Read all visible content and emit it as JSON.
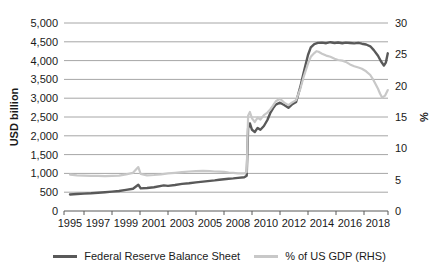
{
  "chart_data": {
    "type": "line",
    "title": "",
    "legend_position": "bottom",
    "grid": true,
    "grid_color": "#a6a6a6",
    "axis_color": "#595959",
    "text_color": "#1a1a1a",
    "x_axis": {
      "tick_labels": [
        "1995",
        "1997",
        "1999",
        "2001",
        "2003",
        "2005",
        "2008",
        "2010",
        "2012",
        "2014",
        "2016",
        "2018"
      ],
      "tick_years": [
        1995,
        1997,
        1999,
        2001,
        2003,
        2005,
        2008,
        2010,
        2012,
        2014,
        2016,
        2018
      ]
    },
    "left_axis": {
      "label": "USD billion",
      "min": 0,
      "max": 5000,
      "step": 500,
      "tick_labels": [
        "5,000",
        "4,500",
        "4,000",
        "3,500",
        "3,000",
        "2,500",
        "2,000",
        "1,500",
        "1,000",
        "500",
        "0"
      ]
    },
    "right_axis": {
      "label": "%",
      "min": 0,
      "max": 30,
      "step": 5,
      "tick_labels": [
        "30",
        "25",
        "20",
        "15",
        "10",
        "5",
        "0"
      ]
    },
    "series": [
      {
        "name": "Federal Reserve Balance Sheet",
        "axis": "left",
        "color": "#595959",
        "points": [
          [
            1995.0,
            440
          ],
          [
            1995.5,
            452
          ],
          [
            1996.0,
            462
          ],
          [
            1996.5,
            472
          ],
          [
            1997.0,
            486
          ],
          [
            1997.5,
            500
          ],
          [
            1998.0,
            515
          ],
          [
            1998.5,
            532
          ],
          [
            1999.0,
            560
          ],
          [
            1999.5,
            592
          ],
          [
            1999.88,
            700
          ],
          [
            2000.05,
            602
          ],
          [
            2000.5,
            612
          ],
          [
            2001.0,
            632
          ],
          [
            2001.7,
            682
          ],
          [
            2002.0,
            668
          ],
          [
            2002.5,
            692
          ],
          [
            2003.0,
            720
          ],
          [
            2003.5,
            738
          ],
          [
            2004.0,
            760
          ],
          [
            2004.5,
            782
          ],
          [
            2005.0,
            800
          ],
          [
            2005.5,
            815
          ],
          [
            2006.0,
            830
          ],
          [
            2006.5,
            845
          ],
          [
            2007.0,
            858
          ],
          [
            2007.5,
            868
          ],
          [
            2008.0,
            880
          ],
          [
            2008.45,
            898
          ],
          [
            2008.62,
            940
          ],
          [
            2008.72,
            2200
          ],
          [
            2008.85,
            2330
          ],
          [
            2009.0,
            2160
          ],
          [
            2009.2,
            2100
          ],
          [
            2009.4,
            2210
          ],
          [
            2009.6,
            2160
          ],
          [
            2009.85,
            2260
          ],
          [
            2010.1,
            2420
          ],
          [
            2010.3,
            2600
          ],
          [
            2010.5,
            2730
          ],
          [
            2010.7,
            2830
          ],
          [
            2011.0,
            2880
          ],
          [
            2011.3,
            2820
          ],
          [
            2011.6,
            2745
          ],
          [
            2011.85,
            2830
          ],
          [
            2012.15,
            2900
          ],
          [
            2012.45,
            3300
          ],
          [
            2012.7,
            3700
          ],
          [
            2013.0,
            4150
          ],
          [
            2013.2,
            4350
          ],
          [
            2013.45,
            4440
          ],
          [
            2013.7,
            4470
          ],
          [
            2014.0,
            4480
          ],
          [
            2014.3,
            4462
          ],
          [
            2014.6,
            4490
          ],
          [
            2014.9,
            4468
          ],
          [
            2015.15,
            4482
          ],
          [
            2015.45,
            4462
          ],
          [
            2015.7,
            4480
          ],
          [
            2016.0,
            4468
          ],
          [
            2016.3,
            4458
          ],
          [
            2016.6,
            4470
          ],
          [
            2016.85,
            4450
          ],
          [
            2017.15,
            4428
          ],
          [
            2017.45,
            4380
          ],
          [
            2017.7,
            4280
          ],
          [
            2018.0,
            4130
          ],
          [
            2018.2,
            3990
          ],
          [
            2018.42,
            3868
          ],
          [
            2018.56,
            3945
          ],
          [
            2018.7,
            4195
          ]
        ]
      },
      {
        "name": "% of US GDP (RHS)",
        "axis": "right",
        "color": "#c8c8c8",
        "points": [
          [
            1995.0,
            5.8
          ],
          [
            1995.5,
            5.7
          ],
          [
            1996.0,
            5.65
          ],
          [
            1996.5,
            5.6
          ],
          [
            1997.0,
            5.6
          ],
          [
            1997.5,
            5.55
          ],
          [
            1998.0,
            5.6
          ],
          [
            1998.5,
            5.65
          ],
          [
            1999.0,
            5.85
          ],
          [
            1999.5,
            6.1
          ],
          [
            1999.88,
            7.0
          ],
          [
            2000.05,
            5.9
          ],
          [
            2000.5,
            5.7
          ],
          [
            2001.0,
            5.75
          ],
          [
            2001.5,
            5.85
          ],
          [
            2002.0,
            6.0
          ],
          [
            2002.5,
            6.1
          ],
          [
            2003.0,
            6.2
          ],
          [
            2003.5,
            6.3
          ],
          [
            2004.0,
            6.35
          ],
          [
            2004.5,
            6.4
          ],
          [
            2005.0,
            6.35
          ],
          [
            2005.5,
            6.3
          ],
          [
            2006.0,
            6.28
          ],
          [
            2006.5,
            6.25
          ],
          [
            2007.0,
            6.15
          ],
          [
            2007.5,
            6.1
          ],
          [
            2008.0,
            6.0
          ],
          [
            2008.45,
            6.0
          ],
          [
            2008.62,
            6.2
          ],
          [
            2008.72,
            15.2
          ],
          [
            2008.85,
            15.8
          ],
          [
            2009.0,
            14.8
          ],
          [
            2009.2,
            14.2
          ],
          [
            2009.4,
            14.9
          ],
          [
            2009.6,
            14.6
          ],
          [
            2009.85,
            15.3
          ],
          [
            2010.1,
            15.7
          ],
          [
            2010.3,
            16.2
          ],
          [
            2010.5,
            16.8
          ],
          [
            2010.7,
            17.5
          ],
          [
            2011.0,
            17.9
          ],
          [
            2011.3,
            17.3
          ],
          [
            2011.6,
            16.9
          ],
          [
            2011.85,
            17.3
          ],
          [
            2012.15,
            17.7
          ],
          [
            2012.45,
            19.5
          ],
          [
            2012.7,
            21.5
          ],
          [
            2013.0,
            23.5
          ],
          [
            2013.2,
            24.6
          ],
          [
            2013.45,
            25.2
          ],
          [
            2013.6,
            25.5
          ],
          [
            2013.75,
            25.4
          ],
          [
            2014.0,
            25.1
          ],
          [
            2014.3,
            24.8
          ],
          [
            2014.6,
            24.6
          ],
          [
            2014.9,
            24.3
          ],
          [
            2015.15,
            24.1
          ],
          [
            2015.45,
            24.0
          ],
          [
            2015.7,
            23.8
          ],
          [
            2016.0,
            23.4
          ],
          [
            2016.3,
            23.1
          ],
          [
            2016.6,
            22.9
          ],
          [
            2016.85,
            22.7
          ],
          [
            2017.15,
            22.3
          ],
          [
            2017.45,
            21.7
          ],
          [
            2017.7,
            20.8
          ],
          [
            2018.0,
            19.5
          ],
          [
            2018.15,
            18.7
          ],
          [
            2018.3,
            18.1
          ],
          [
            2018.5,
            18.4
          ],
          [
            2018.7,
            19.3
          ]
        ]
      }
    ]
  }
}
